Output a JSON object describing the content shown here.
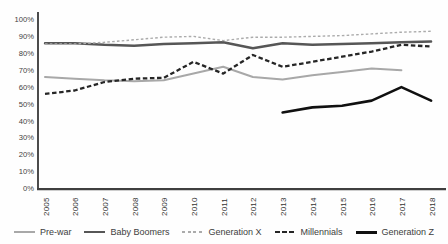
{
  "chart_data": {
    "type": "line",
    "title": "",
    "xlabel": "",
    "ylabel": "",
    "x_labels": [
      "2005",
      "2006",
      "2007",
      "2008",
      "2009",
      "2010",
      "2011",
      "2012",
      "2013",
      "2014",
      "2015",
      "2016",
      "2017",
      "2018"
    ],
    "y_tick_labels": [
      "0%",
      "10%",
      "20%",
      "30%",
      "40%",
      "50%",
      "60%",
      "70%",
      "80%",
      "90%",
      "100%"
    ],
    "ylim": [
      0,
      100
    ],
    "grid": false,
    "legend_position": "bottom",
    "axis_color": "#1f1f1f",
    "baseline_color": "#3f3f3f",
    "series": [
      {
        "name": "Pre-war",
        "color": "#a8a8a8",
        "style": "solid",
        "width": 2,
        "values": [
          66,
          65,
          64,
          63.5,
          64,
          68,
          72,
          66,
          64.5,
          67,
          69,
          71,
          70,
          null
        ]
      },
      {
        "name": "Baby Boomers",
        "color": "#565656",
        "style": "solid",
        "width": 2.4,
        "values": [
          86,
          86,
          85,
          84.5,
          85.5,
          86,
          86.5,
          83,
          86,
          85,
          85.5,
          86,
          86.5,
          87
        ]
      },
      {
        "name": "Generation X",
        "color": "#ababab",
        "style": "dashed",
        "width": 1.4,
        "dash": "2.6,2.2",
        "dash_len": 3,
        "values": [
          85.5,
          85.5,
          86.5,
          88,
          89.5,
          90,
          87.5,
          89.5,
          89.5,
          90,
          90.5,
          91.5,
          92.5,
          93
        ]
      },
      {
        "name": "Millennials",
        "color": "#262626",
        "style": "dashed",
        "width": 2.3,
        "dash": "4.5,2.6",
        "dash_len": 4.5,
        "values": [
          56,
          58,
          63,
          65,
          65.5,
          75,
          68,
          79,
          72,
          75,
          78,
          81,
          85,
          84
        ]
      },
      {
        "name": "Generation Z",
        "color": "#101010",
        "style": "solid",
        "width": 2.6,
        "values": [
          null,
          null,
          null,
          null,
          null,
          null,
          null,
          null,
          45,
          48,
          49,
          52,
          60,
          52
        ]
      }
    ]
  }
}
